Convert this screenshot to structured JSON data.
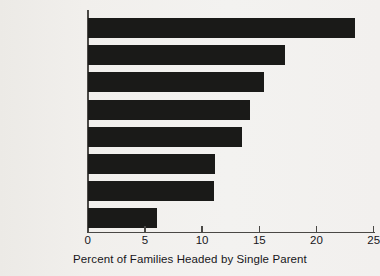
{
  "chart_data": {
    "type": "bar",
    "orientation": "horizontal",
    "title": "",
    "xlabel": "Percent of Families Headed by Single Parent",
    "ylabel": "",
    "xlim": [
      0,
      25
    ],
    "xticks": [
      0,
      5,
      10,
      15,
      20,
      25
    ],
    "xtick_labels": [
      "0",
      "5",
      "10",
      "15",
      "20",
      "25"
    ],
    "grid": false,
    "legend": null,
    "bar_color": "#1a1a18",
    "categories": [
      "United States",
      "Sweden",
      "Canada",
      "West Germany",
      "United Kingdom",
      "Australia",
      "France",
      "Japan"
    ],
    "values": [
      23.3,
      17.2,
      15.4,
      14.2,
      13.5,
      11.1,
      11.0,
      6.0
    ],
    "emphasized_category": "United States"
  },
  "caption": "Percent of Families Headed by Single Parent"
}
